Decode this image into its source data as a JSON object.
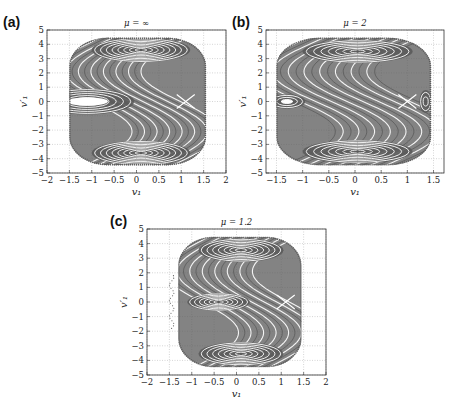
{
  "figure": {
    "background": "#ffffff",
    "orbit_color": "#5a5a5a",
    "grid_color": "#b8b8b8",
    "frame_color": "#333333"
  },
  "chart_data": [
    {
      "panel_label": "(a)",
      "type": "scatter",
      "title": "μ = ∞",
      "xlabel": "v₁",
      "ylabel": "v′₁",
      "xlim": [
        -2,
        2
      ],
      "ylim": [
        -5,
        5
      ],
      "xticks": [
        -2,
        -1.5,
        -1,
        -0.5,
        0,
        0.5,
        1,
        1.5,
        2
      ],
      "xtick_labels": [
        "−2",
        "−1.5",
        "−1",
        "−0.5",
        "0",
        "0.5",
        "1",
        "1.5",
        "2"
      ],
      "yticks": [
        -5,
        -4,
        -3,
        -2,
        -1,
        0,
        1,
        2,
        3,
        4,
        5
      ],
      "ytick_labels": [
        "−5",
        "−4",
        "−3",
        "−2",
        "−1",
        "0",
        "1",
        "2",
        "3",
        "4",
        "5"
      ],
      "grid": true,
      "frame_px": {
        "x0": 47,
        "y0": 30,
        "x1": 226,
        "y1": 173
      },
      "boundary": {
        "xmin": -1.5,
        "xmax": 1.55,
        "ymin": -4.45,
        "ymax": 4.45
      },
      "islands": [
        {
          "cx": 0.1,
          "cy": 3.6,
          "rx_max": 1.1,
          "ry_max": 0.85,
          "rings": 8
        },
        {
          "cx": 0.1,
          "cy": -3.6,
          "rx_max": 1.1,
          "ry_max": 0.85,
          "rings": 8
        },
        {
          "cx": -1.1,
          "cy": 0.0,
          "rx_max": 1.05,
          "ry_max": 0.9,
          "rings": 6,
          "hole": 0.2
        }
      ],
      "separatrix": {
        "amp": 1.6,
        "x_center": 0.0,
        "bands": 7,
        "spread": 0.28
      },
      "hyperbolic_point": {
        "x": 1.1,
        "y": 0.0
      }
    },
    {
      "panel_label": "(b)",
      "type": "scatter",
      "title": "μ = 2",
      "xlabel": "v₁",
      "ylabel": "v′₁",
      "xlim": [
        -1.7,
        1.7
      ],
      "ylim": [
        -5,
        5
      ],
      "xticks": [
        -1.5,
        -1,
        -0.5,
        0,
        0.5,
        1,
        1.5
      ],
      "xtick_labels": [
        "−1.5",
        "−1",
        "−0.5",
        "0",
        "0.5",
        "1",
        "1.5"
      ],
      "yticks": [
        -5,
        -4,
        -3,
        -2,
        -1,
        0,
        1,
        2,
        3,
        4,
        5
      ],
      "ytick_labels": [
        "−5",
        "−4",
        "−3",
        "−2",
        "−1",
        "0",
        "1",
        "2",
        "3",
        "4",
        "5"
      ],
      "grid": true,
      "frame_px": {
        "x0": 266,
        "y0": 30,
        "x1": 444,
        "y1": 173
      },
      "boundary": {
        "xmin": -1.5,
        "xmax": 1.45,
        "ymin": -4.45,
        "ymax": 4.45
      },
      "islands": [
        {
          "cx": 0.05,
          "cy": 3.5,
          "rx_max": 1.05,
          "ry_max": 0.8,
          "rings": 7
        },
        {
          "cx": 0.05,
          "cy": -3.5,
          "rx_max": 1.05,
          "ry_max": 0.8,
          "rings": 7
        },
        {
          "cx": -1.3,
          "cy": 0.0,
          "rx_max": 0.35,
          "ry_max": 0.5,
          "rings": 3,
          "hole": 0.15
        },
        {
          "cx": 1.35,
          "cy": 0.0,
          "rx_max": 0.12,
          "ry_max": 0.8,
          "rings": 2
        }
      ],
      "separatrix": {
        "amp": 1.5,
        "x_center": 0.0,
        "bands": 8,
        "spread": 0.3
      },
      "hyperbolic_point": {
        "x": 1.0,
        "y": 0.0
      }
    },
    {
      "panel_label": "(c)",
      "type": "scatter",
      "title": "μ = 1.2",
      "xlabel": "v₁",
      "ylabel": "v′₁",
      "xlim": [
        -2,
        2
      ],
      "ylim": [
        -5,
        5
      ],
      "xticks": [
        -2,
        -1.5,
        -1,
        -0.5,
        0,
        0.5,
        1,
        1.5,
        2
      ],
      "xtick_labels": [
        "−2",
        "−1.5",
        "−1",
        "−0.5",
        "0",
        "0.5",
        "1",
        "1.5",
        "2"
      ],
      "yticks": [
        -5,
        -4,
        -3,
        -2,
        -1,
        0,
        1,
        2,
        3,
        4,
        5
      ],
      "ytick_labels": [
        "−5",
        "−4",
        "−3",
        "−2",
        "−1",
        "0",
        "1",
        "2",
        "3",
        "4",
        "5"
      ],
      "grid": true,
      "frame_px": {
        "x0": 147,
        "y0": 229,
        "x1": 326,
        "y1": 375
      },
      "boundary": {
        "xmin": -1.3,
        "xmax": 1.45,
        "ymin": -4.45,
        "ymax": 4.45
      },
      "islands": [
        {
          "cx": 0.1,
          "cy": 3.55,
          "rx_max": 0.95,
          "ry_max": 0.8,
          "rings": 7
        },
        {
          "cx": 0.1,
          "cy": -3.55,
          "rx_max": 0.95,
          "ry_max": 0.8,
          "rings": 7
        },
        {
          "cx": -0.4,
          "cy": 0.0,
          "rx_max": 0.7,
          "ry_max": 0.6,
          "rings": 6
        }
      ],
      "separatrix": {
        "amp": 1.5,
        "x_center": 0.2,
        "bands": 7,
        "spread": 0.28
      },
      "hyperbolic_point": {
        "x": 1.1,
        "y": 0.0
      },
      "scattered_points_left": {
        "x": -1.45,
        "ymin": -1.8,
        "ymax": 1.8
      }
    }
  ]
}
